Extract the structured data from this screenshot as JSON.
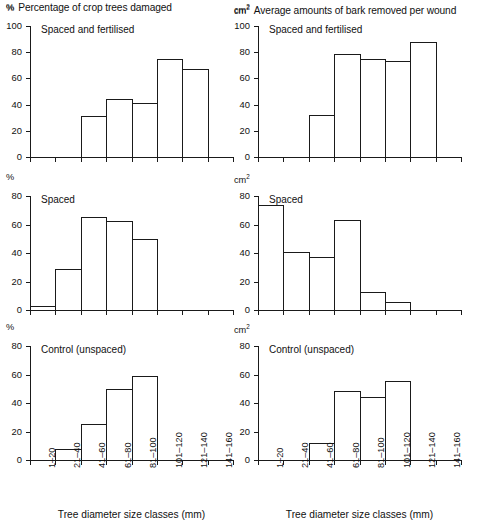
{
  "figure": {
    "columns": [
      {
        "unit": "%",
        "unit_sup": "",
        "title": "Percentage of crop trees damaged"
      },
      {
        "unit": "cm",
        "unit_sup": "2",
        "title": "Average amounts of bark removed per wound"
      }
    ],
    "x_axis_title": "Tree diameter size classes (mm)",
    "categories": [
      "1–20",
      "21–40",
      "41–60",
      "61–80",
      "81–100",
      "101–120",
      "121–140",
      "141–160"
    ],
    "line_color": "#1a1a1a",
    "background_color": "#ffffff"
  },
  "chart_data": [
    {
      "id": "panel-tl",
      "type": "bar",
      "title": "Percentage of crop trees damaged",
      "subtitle": "Spaced and fertilised",
      "panel_label": "Spaced and fertilised",
      "unit": "%",
      "unit_sup": "",
      "xlabel": "Tree diameter size classes (mm)",
      "ylabel": "%",
      "ylim": [
        0,
        100
      ],
      "yticks": [
        0,
        20,
        40,
        60,
        80,
        100
      ],
      "grid": false,
      "legend": "none",
      "categories": [
        "1–20",
        "21–40",
        "41–60",
        "61–80",
        "81–100",
        "101–120",
        "121–140",
        "141–160"
      ],
      "values": [
        null,
        null,
        31.5,
        44,
        41,
        74.5,
        67,
        null
      ]
    },
    {
      "id": "panel-tr",
      "type": "bar",
      "title": "Average amounts of bark removed per wound",
      "subtitle": "Spaced and fertilised",
      "panel_label": "Spaced and fertilised",
      "unit": "cm",
      "unit_sup": "2",
      "xlabel": "Tree diameter size classes (mm)",
      "ylabel": "cm2",
      "ylim": [
        0,
        100
      ],
      "yticks": [
        0,
        20,
        40,
        60,
        80,
        100
      ],
      "grid": false,
      "legend": "none",
      "categories": [
        "1–20",
        "21–40",
        "41–60",
        "61–80",
        "81–100",
        "101–120",
        "121–140",
        "141–160"
      ],
      "values": [
        null,
        null,
        32,
        78.5,
        75,
        73,
        88,
        null
      ]
    },
    {
      "id": "panel-ml",
      "type": "bar",
      "title": "Percentage of crop trees damaged",
      "subtitle": "Spaced",
      "panel_label": "Spaced",
      "unit": "%",
      "unit_sup": "",
      "xlabel": "Tree diameter size classes (mm)",
      "ylabel": "%",
      "ylim": [
        0,
        80
      ],
      "yticks": [
        0,
        20,
        40,
        60,
        80
      ],
      "grid": false,
      "legend": "none",
      "categories": [
        "1–20",
        "21–40",
        "41–60",
        "61–80",
        "81–100",
        "101–120",
        "121–140",
        "141–160"
      ],
      "values": [
        3,
        29,
        65,
        62.5,
        50,
        null,
        null,
        null
      ]
    },
    {
      "id": "panel-mr",
      "type": "bar",
      "title": "Average amounts of bark removed per wound",
      "subtitle": "Spaced",
      "panel_label": "Spaced",
      "unit": "cm",
      "unit_sup": "2",
      "xlabel": "Tree diameter size classes (mm)",
      "ylabel": "cm2",
      "ylim": [
        0,
        80
      ],
      "yticks": [
        0,
        20,
        40,
        60,
        80
      ],
      "grid": false,
      "legend": "none",
      "categories": [
        "1–20",
        "21–40",
        "41–60",
        "61–80",
        "81–100",
        "101–120",
        "121–140",
        "141–160"
      ],
      "values": [
        74,
        41,
        37,
        63,
        12.5,
        5.5,
        null,
        null
      ]
    },
    {
      "id": "panel-bl",
      "type": "bar",
      "title": "Percentage of crop trees damaged",
      "subtitle": "Control (unspaced)",
      "panel_label": "Control (unspaced)",
      "unit": "%",
      "unit_sup": "",
      "xlabel": "Tree diameter size classes (mm)",
      "ylabel": "%",
      "ylim": [
        0,
        80
      ],
      "yticks": [
        0,
        20,
        40,
        60,
        80
      ],
      "grid": false,
      "legend": "none",
      "categories": [
        "1–20",
        "21–40",
        "41–60",
        "61–80",
        "81–100",
        "101–120",
        "121–140",
        "141–160"
      ],
      "values": [
        null,
        8,
        25.5,
        49.5,
        59,
        null,
        null,
        null
      ]
    },
    {
      "id": "panel-br",
      "type": "bar",
      "title": "Average amounts of bark removed per wound",
      "subtitle": "Control (unspaced)",
      "panel_label": "Control (unspaced)",
      "unit": "cm",
      "unit_sup": "2",
      "xlabel": "Tree diameter size classes (mm)",
      "ylabel": "cm2",
      "ylim": [
        0,
        80
      ],
      "yticks": [
        0,
        20,
        40,
        60,
        80
      ],
      "grid": false,
      "legend": "none",
      "categories": [
        "1–20",
        "21–40",
        "41–60",
        "61–80",
        "81–100",
        "101–120",
        "121–140",
        "141–160"
      ],
      "values": [
        null,
        null,
        12,
        48.5,
        44.5,
        55.5,
        null,
        null
      ]
    }
  ]
}
